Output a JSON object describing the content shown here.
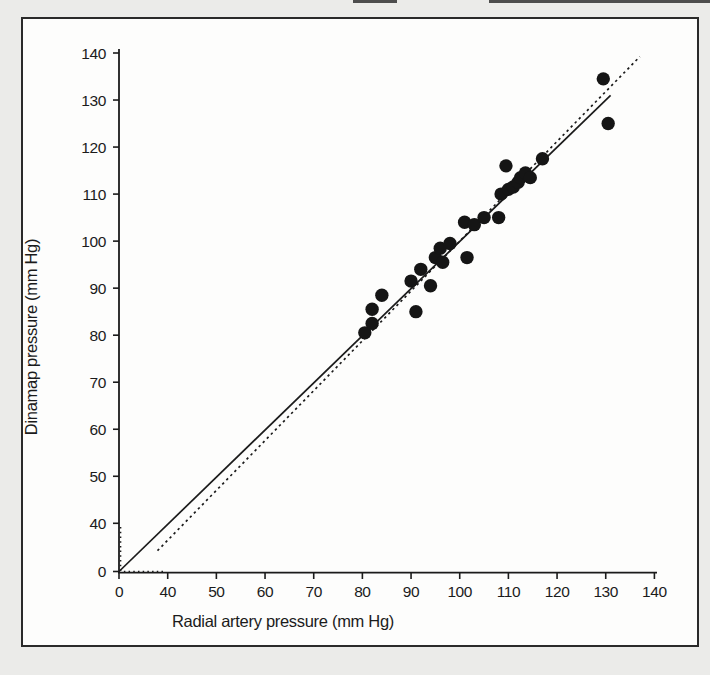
{
  "figure": {
    "background_color": "#ebebe9",
    "panel_color": "#fdfdfc",
    "border_color": "#2a2a2a",
    "ink_color": "#1b1b1b",
    "dot_color": "#151515"
  },
  "chart_data": {
    "type": "scatter",
    "title": "",
    "xlabel": "Radial artery pressure (mm Hg)",
    "ylabel": "Dinamap pressure (mm Hg)",
    "x_ticks": [
      0,
      40,
      50,
      60,
      70,
      80,
      90,
      100,
      110,
      120,
      130,
      140
    ],
    "y_ticks": [
      0,
      40,
      50,
      60,
      70,
      80,
      90,
      100,
      110,
      120,
      130,
      140
    ],
    "xlim": [
      0,
      140
    ],
    "ylim": [
      0,
      140
    ],
    "axis_break": "axes compressed between 0 and 40 (single tick gap), marked by dotted segments at origin",
    "grid": false,
    "legend": null,
    "points": [
      [
        80.5,
        80.5
      ],
      [
        82,
        82.5
      ],
      [
        82,
        85.5
      ],
      [
        84,
        88.5
      ],
      [
        91,
        85
      ],
      [
        90,
        91.5
      ],
      [
        92,
        94
      ],
      [
        94,
        90.5
      ],
      [
        95,
        96.5
      ],
      [
        96.5,
        95.5
      ],
      [
        96,
        98.5
      ],
      [
        98,
        99.5
      ],
      [
        101,
        104
      ],
      [
        103,
        103.5
      ],
      [
        101.5,
        96.5
      ],
      [
        105,
        105
      ],
      [
        108,
        105
      ],
      [
        108.5,
        110
      ],
      [
        110,
        111
      ],
      [
        111,
        111.5
      ],
      [
        112,
        112.5
      ],
      [
        112.5,
        113.5
      ],
      [
        113.5,
        114.5
      ],
      [
        114.5,
        113.5
      ],
      [
        117,
        117.5
      ],
      [
        109.5,
        116
      ],
      [
        129.5,
        134.5
      ],
      [
        130.5,
        125
      ]
    ],
    "identity_line": {
      "style": "solid",
      "from": [
        0,
        0
      ],
      "to": [
        131,
        131
      ]
    },
    "regression_line": {
      "style": "dotted",
      "slope": 1.06,
      "intercept": -6,
      "x_from": 37.9,
      "x_to": 137
    },
    "break_marks": {
      "vertical": {
        "x": 1.3,
        "y_from": 0.5,
        "y_to": 37
      },
      "horizontal": {
        "y": 0,
        "x_from": 4,
        "x_to": 38
      }
    }
  }
}
